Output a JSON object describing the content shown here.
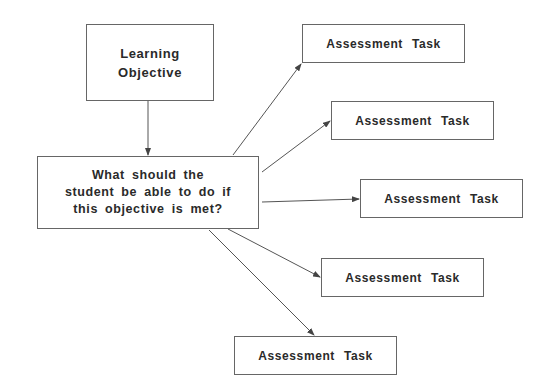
{
  "diagram": {
    "objective": {
      "lines": [
        "Learning",
        "Objective"
      ]
    },
    "question": {
      "lines": [
        "What should the",
        "student be able to do if",
        "this objective is met?"
      ]
    },
    "tasks": [
      {
        "label": "Assessment Task"
      },
      {
        "label": "Assessment Task"
      },
      {
        "label": "Assessment Task"
      },
      {
        "label": "Assessment Task"
      },
      {
        "label": "Assessment Task"
      }
    ],
    "edges": [
      {
        "from": "objective",
        "to": "question"
      },
      {
        "from": "question",
        "to": "task-1"
      },
      {
        "from": "question",
        "to": "task-2"
      },
      {
        "from": "question",
        "to": "task-3"
      },
      {
        "from": "question",
        "to": "task-4"
      },
      {
        "from": "question",
        "to": "task-5"
      }
    ],
    "colors": {
      "border": "#666666",
      "text": "#2a2a2a",
      "arrow": "#555555",
      "background": "#ffffff"
    }
  }
}
